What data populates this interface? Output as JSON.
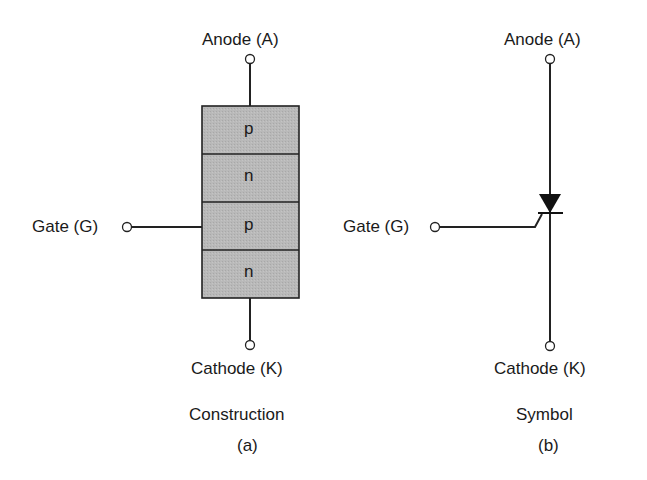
{
  "figure": {
    "construction": {
      "anode_label": "Anode (A)",
      "gate_label": "Gate (G)",
      "cathode_label": "Cathode (K)",
      "layers": [
        "p",
        "n",
        "p",
        "n"
      ],
      "caption": "Construction",
      "sublabel": "(a)",
      "layer_fill": "#b8b8b8"
    },
    "symbol": {
      "anode_label": "Anode (A)",
      "gate_label": "Gate (G)",
      "cathode_label": "Cathode (K)",
      "caption": "Symbol",
      "sublabel": "(b)"
    }
  }
}
